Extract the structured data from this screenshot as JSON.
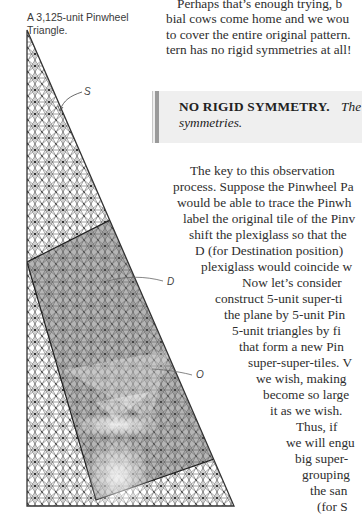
{
  "figure": {
    "caption": "A 3,125-unit Pinwheel Triangle.",
    "labels": {
      "s": "S",
      "d": "D",
      "o": "O"
    },
    "colors": {
      "tile_line": "#3a3a3a",
      "shaded_region": "#6a6a6a",
      "background": "#ffffff"
    }
  },
  "top_paragraph": {
    "partial_top": "p g",
    "lines": [
      "Perhaps that’s enough trying, b",
      "bial cows come home and we wou",
      "to cover the entire original pattern.",
      "tern has no rigid symmetries at all!"
    ]
  },
  "sidebar": {
    "title": "NO RIGID SYMMETRY.",
    "text_line1": "The",
    "text_line2": "symmetries."
  },
  "body": {
    "lines": [
      "The key to this observation",
      "process. Suppose the Pinwheel Pa",
      "would be able to trace the Pinwh",
      "label the original tile of the Pinv",
      "shift the plexiglass so that the",
      "D (for Destination position)",
      "plexiglass would coincide w",
      "Now let’s consider",
      "construct 5-unit super-ti",
      "the plane by 5-unit Pin",
      "5-unit triangles by fi",
      "that form a new Pin",
      "super-super-tiles. V",
      "we wish, making",
      "become so large",
      "it as we wish.",
      "Thus, if",
      "we will engu",
      "big super-",
      "grouping",
      "the san",
      "(for S"
    ]
  }
}
